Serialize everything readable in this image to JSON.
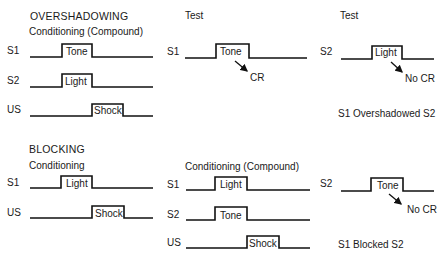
{
  "overshadowing": {
    "title": "OVERSHADOWING",
    "conditioning": {
      "heading": "Conditioning (Compound)",
      "rows": [
        {
          "label": "S1",
          "stimulus": "Tone"
        },
        {
          "label": "S2",
          "stimulus": "Light"
        },
        {
          "label": "US",
          "stimulus": "Shock"
        }
      ]
    },
    "test1": {
      "heading": "Test",
      "label": "S1",
      "stimulus": "Tone",
      "response": "CR"
    },
    "test2": {
      "heading": "Test",
      "label": "S2",
      "stimulus": "Light",
      "response": "No CR"
    },
    "conclusion": "S1 Overshadowed S2"
  },
  "blocking": {
    "title": "BLOCKING",
    "conditioning": {
      "heading": "Conditioning",
      "rows": [
        {
          "label": "S1",
          "stimulus": "Light"
        },
        {
          "label": "US",
          "stimulus": "Shock"
        }
      ]
    },
    "compound": {
      "heading": "Conditioning (Compound)",
      "rows": [
        {
          "label": "S1",
          "stimulus": "Light"
        },
        {
          "label": "S2",
          "stimulus": "Tone"
        },
        {
          "label": "US",
          "stimulus": "Shock"
        }
      ]
    },
    "test": {
      "label": "S2",
      "stimulus": "Tone",
      "response": "No CR"
    },
    "conclusion": "S1 Blocked S2"
  },
  "colors": {
    "line": "#111111",
    "text": "#1a1a1a",
    "background": "#ffffff"
  }
}
